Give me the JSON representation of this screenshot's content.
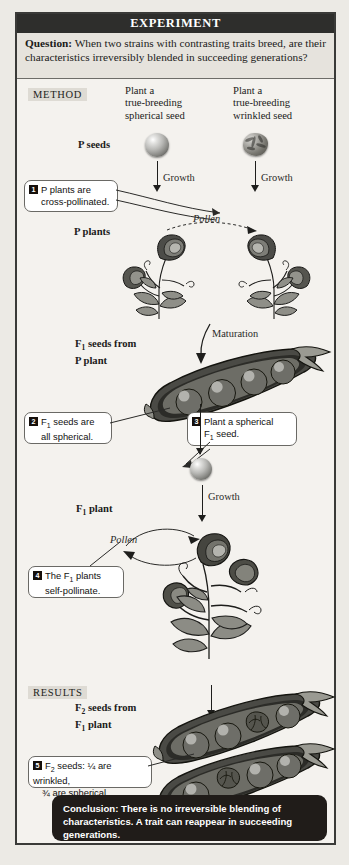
{
  "figure": {
    "banner": "EXPERIMENT",
    "question_label": "Question:",
    "question_text": " When two strains with contrasting traits breed, are their characteristics irreversibly blended in succeeding generations?",
    "method_tag": "METHOD",
    "results_tag": "RESULTS",
    "conclusion": "Conclusion: There is no irreversible blending of characteristics. A trait can reappear in succeeding generations."
  },
  "top_labels": {
    "left_plant": "Plant a\ntrue-breeding\nspherical seed",
    "left_line1": "Plant a",
    "left_line2": "true-breeding",
    "left_line3": "spherical seed",
    "right_line1": "Plant a",
    "right_line2": "true-breeding",
    "right_line3": "wrinkled seed"
  },
  "stage_labels": {
    "p_seeds": "P seeds",
    "p_plants": "P plants",
    "f1_seeds_line1": "F",
    "f1_seeds_sub": "1",
    "f1_seeds_line1_rest": " seeds from",
    "f1_seeds_line2": "P plant",
    "f1_plant_pre": "F",
    "f1_plant_sub": "1",
    "f1_plant_rest": " plant",
    "f2_seeds_pre": "F",
    "f2_seeds_sub": "2",
    "f2_seeds_rest": " seeds from",
    "f2_seeds_line2_pre": "F",
    "f2_seeds_line2_sub": "1",
    "f2_seeds_line2_rest": " plant"
  },
  "process_labels": {
    "growth_left": "Growth",
    "growth_right": "Growth",
    "pollen_top": "Pollen",
    "maturation": "Maturation",
    "growth_f1": "Growth",
    "pollen_f1": "Pollen"
  },
  "callouts": [
    {
      "num": "1",
      "line1": "P plants are",
      "line2": "cross-pollinated."
    },
    {
      "num": "2",
      "line1_pre": "F",
      "line1_sub": "1",
      "line1_rest": " seeds are",
      "line2": "all spherical."
    },
    {
      "num": "3",
      "line1": "Plant a spherical",
      "line2_pre": "F",
      "line2_sub": "1",
      "line2_rest": " seed."
    },
    {
      "num": "4",
      "line1_pre": "The F",
      "line1_sub": "1",
      "line1_rest": " plants",
      "line2": "self-pollinate."
    },
    {
      "num": "5",
      "line1_pre": "F",
      "line1_sub": "2",
      "line1_rest": " seeds: ¼ are wrinkled,",
      "line2": "¾ are spherical"
    }
  ],
  "colors": {
    "banner_bg": "#2e2e2c",
    "question_bg": "#e6e3dd",
    "tag_bg": "#dedbd4",
    "frame_border": "#3a3a38",
    "page_bg": "#eceae5",
    "panel_bg": "#f4f2ee",
    "conclusion_bg": "#201c19",
    "ink": "#1b1b1a"
  }
}
